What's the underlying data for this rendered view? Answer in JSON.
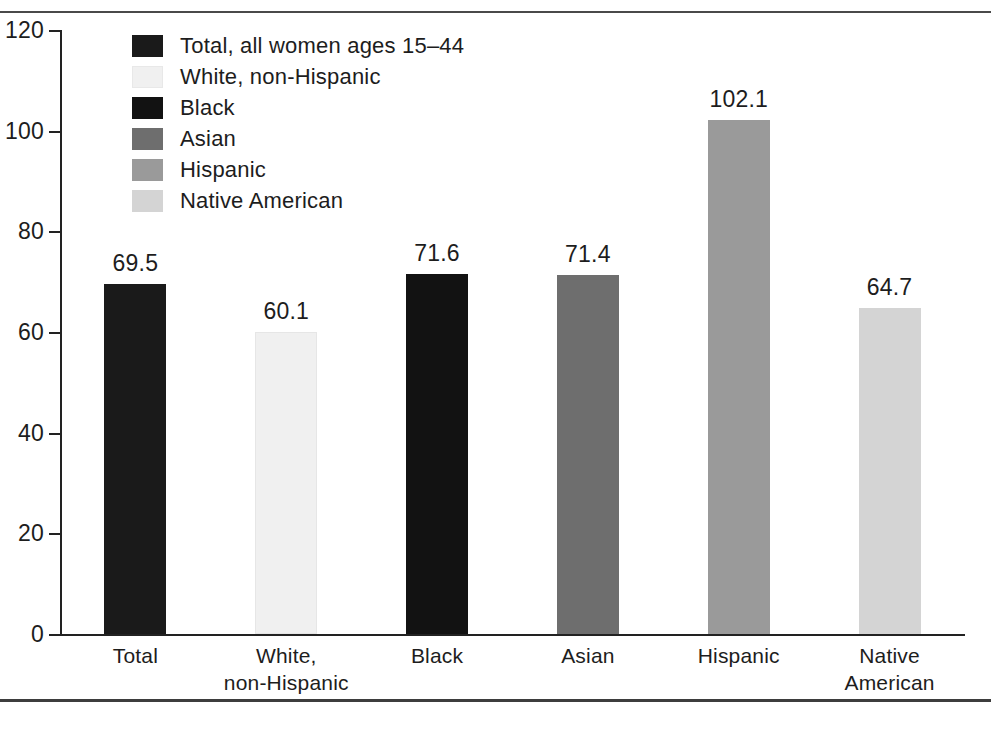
{
  "chart_data": {
    "type": "bar",
    "title": "",
    "xlabel": "",
    "ylabel": "",
    "ylim": [
      0,
      120
    ],
    "yticks": [
      "0",
      "20",
      "40",
      "60",
      "80",
      "100",
      "120"
    ],
    "grid": false,
    "legend_position": "top-left inside plot area",
    "categories": [
      "Total",
      "White,\nnon-Hispanic",
      "Black",
      "Asian",
      "Hispanic",
      "Native\nAmerican"
    ],
    "values": [
      69.5,
      60.1,
      71.6,
      71.4,
      102.1,
      64.7
    ],
    "value_labels": [
      "69.5",
      "60.1",
      "71.6",
      "71.4",
      "102.1",
      "64.7"
    ],
    "colors": [
      "#1a1a1a",
      "#f0f0f0",
      "#121212",
      "#6e6e6e",
      "#9a9a9a",
      "#d4d4d4"
    ],
    "legend": [
      {
        "label": "Total, all women ages 15–44",
        "color": "#1a1a1a"
      },
      {
        "label": "White, non-Hispanic",
        "color": "#f0f0f0"
      },
      {
        "label": "Black",
        "color": "#121212"
      },
      {
        "label": "Asian",
        "color": "#6e6e6e"
      },
      {
        "label": "Hispanic",
        "color": "#9a9a9a"
      },
      {
        "label": "Native American",
        "color": "#d4d4d4"
      }
    ]
  },
  "style": {
    "axis_color": "#222222",
    "text_color": "#1d1d1d",
    "rule_color": "#4a4a4a",
    "background": "#ffffff"
  }
}
